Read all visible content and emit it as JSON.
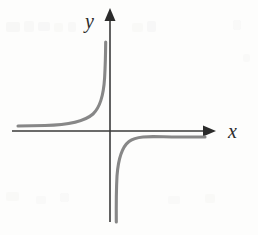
{
  "figure": {
    "background_color": "#fdfdfc",
    "width": 258,
    "height": 235
  },
  "axes": {
    "color": "#3a3a3a",
    "stroke_width": 1.6,
    "x_axis": {
      "label": "x",
      "label_x": 228,
      "label_y": 138,
      "label_font_size": 20,
      "y_position": 131,
      "start_x": 12,
      "end_x": 205,
      "arrow_tip_x": 216,
      "arrow_half_height": 5.5,
      "arrow_length": 13
    },
    "y_axis": {
      "label": "y",
      "label_x": 85,
      "label_y": 28,
      "label_font_size": 20,
      "x_position": 110,
      "start_y": 222,
      "end_y": 19,
      "arrow_tip_y": 8,
      "arrow_half_width": 5.5,
      "arrow_length": 13
    }
  },
  "curve": {
    "name": "hyperbola",
    "color": "#878787",
    "stroke_width": 3.1,
    "vertical_asymptote_x": 110,
    "horizontal_asymptote_y": 131,
    "upper_left_branch": {
      "description": "Upper-left branch: approaches y-axis from the left rising to +infinity, and approaches the x-axis from above as x decreases",
      "path": "M 18 126 L 45 125.5 C 68 125 84 122 93 114 C 100 107.5 103.5 96 104.6 78 C 105.4 64 105.6 52 105.7 42"
    },
    "lower_right_branch": {
      "description": "Lower-right branch: descends to -infinity just right of the y-axis and approaches the x-axis from below as x increases",
      "path": "M 116.3 222 C 116.2 208 116.1 192 117 176 C 118.3 158 122 147 129 141.5 C 138 134.5 155 137 178 137 L 205 137"
    }
  },
  "scan_artifacts": [
    {
      "x": 6,
      "y": 22,
      "width": 14,
      "height": 10,
      "opacity": 0.55
    },
    {
      "x": 24,
      "y": 21,
      "width": 10,
      "height": 11,
      "opacity": 0.45
    },
    {
      "x": 38,
      "y": 22,
      "width": 12,
      "height": 9,
      "opacity": 0.5
    },
    {
      "x": 54,
      "y": 23,
      "width": 9,
      "height": 9,
      "opacity": 0.4
    },
    {
      "x": 68,
      "y": 22,
      "width": 8,
      "height": 10,
      "opacity": 0.45
    },
    {
      "x": 132,
      "y": 23,
      "width": 11,
      "height": 9,
      "opacity": 0.42
    },
    {
      "x": 147,
      "y": 21,
      "width": 9,
      "height": 11,
      "opacity": 0.5
    },
    {
      "x": 6,
      "y": 192,
      "width": 13,
      "height": 9,
      "opacity": 0.4
    },
    {
      "x": 36,
      "y": 196,
      "width": 10,
      "height": 8,
      "opacity": 0.35
    },
    {
      "x": 60,
      "y": 193,
      "width": 9,
      "height": 9,
      "opacity": 0.38
    },
    {
      "x": 168,
      "y": 196,
      "width": 12,
      "height": 8,
      "opacity": 0.36
    },
    {
      "x": 205,
      "y": 194,
      "width": 10,
      "height": 9,
      "opacity": 0.4
    },
    {
      "x": 233,
      "y": 20,
      "width": 8,
      "height": 10,
      "opacity": 0.38
    },
    {
      "x": 243,
      "y": 54,
      "width": 7,
      "height": 8,
      "opacity": 0.32
    }
  ],
  "chart_data": {
    "type": "line",
    "title": "",
    "xlabel": "x",
    "ylabel": "y",
    "subtitle": "",
    "grid": false,
    "legend": null,
    "legend_position": "none",
    "annotations": [],
    "tick_labels": {
      "x": [],
      "y": []
    },
    "xlim": [
      -5.9,
      6.5
    ],
    "ylim": [
      -6.1,
      6.9
    ],
    "asymptotes": {
      "vertical_x": 0,
      "horizontal_y": 0
    },
    "series": [
      {
        "name": "upper-left branch",
        "quadrant": 2,
        "x": [
          -5.75,
          -5.0,
          -4.0,
          -3.0,
          -2.4,
          -1.9,
          -1.5,
          -1.15,
          -0.9,
          -0.7,
          -0.55,
          -0.42,
          -0.32,
          -0.25,
          -0.2,
          -0.17,
          -0.15
        ],
        "y": [
          0.16,
          0.18,
          0.22,
          0.3,
          0.38,
          0.48,
          0.6,
          0.78,
          1.0,
          1.3,
          1.65,
          2.15,
          2.8,
          3.6,
          4.5,
          5.3,
          6.0
        ]
      },
      {
        "name": "lower-right branch",
        "quadrant": 4,
        "x": [
          0.15,
          0.17,
          0.2,
          0.25,
          0.32,
          0.42,
          0.55,
          0.7,
          0.9,
          1.15,
          1.5,
          1.9,
          2.4,
          3.0,
          4.0,
          5.0,
          5.95
        ],
        "y": [
          -6.0,
          -5.3,
          -4.5,
          -3.6,
          -2.8,
          -2.15,
          -1.65,
          -1.3,
          -1.0,
          -0.78,
          -0.6,
          -0.48,
          -0.38,
          -0.3,
          -0.22,
          -0.18,
          -0.16
        ]
      }
    ]
  }
}
